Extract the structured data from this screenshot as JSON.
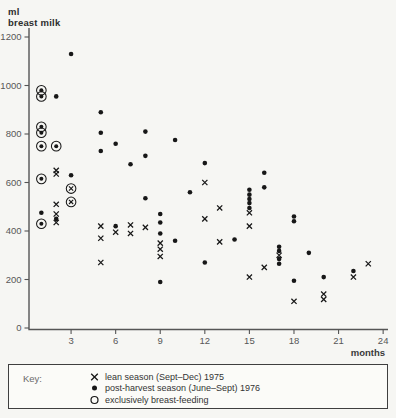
{
  "labels": {
    "ylabel_line1": "ml",
    "ylabel_line2": "breast milk",
    "xlabel": "months"
  },
  "legend": {
    "key_label": "Key:",
    "entries": [
      {
        "marker": "x",
        "label": "lean season (Sept–Dec) 1975"
      },
      {
        "marker": "filled-dot",
        "label": "post-harvest season (June–Sept) 1976"
      },
      {
        "marker": "open-circle",
        "label": "exclusively breast-feeding"
      }
    ]
  },
  "colors": {
    "marker": "#171717",
    "axis": "#555555",
    "tick_label": "#575757",
    "text": "#2d2d2d",
    "background": "#f6f6f3",
    "legend_background": "#fbfbf8"
  },
  "chart_data": {
    "type": "scatter",
    "title": "",
    "xlabel": "months",
    "ylabel": "ml breast milk",
    "xlim": [
      0,
      24.8
    ],
    "ylim": [
      0,
      1240
    ],
    "x_ticks": [
      3,
      6,
      9,
      12,
      15,
      18,
      21,
      24
    ],
    "y_ticks": [
      0,
      200,
      400,
      600,
      800,
      1000,
      1200
    ],
    "grid": false,
    "legend_position": "bottom-box",
    "series": [
      {
        "name": "lean season (Sept–Dec) 1975",
        "marker": "x",
        "points": [
          [
            2,
            650
          ],
          [
            2,
            635
          ],
          [
            2,
            510
          ],
          [
            2,
            470
          ],
          [
            2,
            435
          ],
          [
            5,
            420
          ],
          [
            5,
            370
          ],
          [
            5,
            270
          ],
          [
            6,
            395
          ],
          [
            7,
            425
          ],
          [
            7,
            390
          ],
          [
            8,
            415
          ],
          [
            9,
            350
          ],
          [
            9,
            325
          ],
          [
            9,
            295
          ],
          [
            12,
            600
          ],
          [
            12,
            450
          ],
          [
            13,
            495
          ],
          [
            13,
            355
          ],
          [
            15,
            475
          ],
          [
            15,
            420
          ],
          [
            15,
            210
          ],
          [
            16,
            250
          ],
          [
            17,
            300
          ],
          [
            18,
            110
          ],
          [
            20,
            140
          ],
          [
            20,
            118
          ],
          [
            22,
            210
          ],
          [
            23,
            265
          ]
        ]
      },
      {
        "name": "post-harvest season (June–Sept) 1976",
        "marker": "filled-dot",
        "points": [
          [
            1,
            475
          ],
          [
            2,
            955
          ],
          [
            2,
            450
          ],
          [
            3,
            1130
          ],
          [
            3,
            630
          ],
          [
            5,
            890
          ],
          [
            5,
            805
          ],
          [
            5,
            730
          ],
          [
            6,
            760
          ],
          [
            6,
            420
          ],
          [
            7,
            675
          ],
          [
            8,
            810
          ],
          [
            8,
            710
          ],
          [
            8,
            535
          ],
          [
            9,
            470
          ],
          [
            9,
            435
          ],
          [
            9,
            390
          ],
          [
            9,
            190
          ],
          [
            10,
            775
          ],
          [
            10,
            360
          ],
          [
            11,
            560
          ],
          [
            12,
            680
          ],
          [
            12,
            270
          ],
          [
            14,
            365
          ],
          [
            15,
            570
          ],
          [
            15,
            550
          ],
          [
            15,
            532
          ],
          [
            15,
            515
          ],
          [
            15,
            495
          ],
          [
            16,
            640
          ],
          [
            16,
            580
          ],
          [
            17,
            335
          ],
          [
            17,
            318
          ],
          [
            17,
            285
          ],
          [
            17,
            265
          ],
          [
            18,
            460
          ],
          [
            18,
            440
          ],
          [
            18,
            195
          ],
          [
            19,
            310
          ],
          [
            20,
            210
          ],
          [
            22,
            235
          ]
        ]
      },
      {
        "name": "exclusively breast-feeding (circled dot)",
        "marker": "circled-dot",
        "points": [
          [
            1,
            980
          ],
          [
            1,
            955
          ],
          [
            1,
            830
          ],
          [
            1,
            805
          ],
          [
            1,
            750
          ],
          [
            2,
            750
          ],
          [
            1,
            615
          ],
          [
            1,
            430
          ]
        ]
      },
      {
        "name": "exclusively breast-feeding (circled x)",
        "marker": "circled-x",
        "points": [
          [
            3,
            575
          ],
          [
            3,
            520
          ]
        ]
      }
    ]
  }
}
